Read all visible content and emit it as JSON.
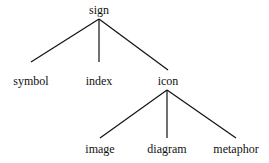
{
  "diagram": {
    "type": "tree",
    "nodes": {
      "root": {
        "label": "sign",
        "x": 99,
        "y": 4
      },
      "symbol": {
        "label": "symbol",
        "x": 31,
        "y": 75
      },
      "index": {
        "label": "index",
        "x": 99,
        "y": 75
      },
      "icon": {
        "label": "icon",
        "x": 168,
        "y": 75
      },
      "image": {
        "label": "image",
        "x": 100,
        "y": 143
      },
      "diagram": {
        "label": "diagram",
        "x": 167,
        "y": 143
      },
      "metaphor": {
        "label": "metaphor",
        "x": 236,
        "y": 143
      }
    },
    "edges": [
      [
        "sign",
        "symbol"
      ],
      [
        "sign",
        "index"
      ],
      [
        "sign",
        "icon"
      ],
      [
        "icon",
        "image"
      ],
      [
        "icon",
        "diagram"
      ],
      [
        "icon",
        "metaphor"
      ]
    ],
    "line_color": "#111111"
  }
}
